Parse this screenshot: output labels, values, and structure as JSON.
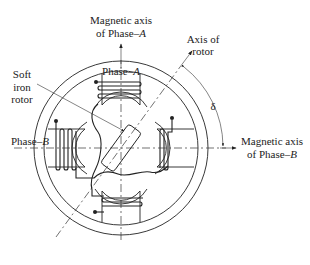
{
  "figure": {
    "type": "diagram",
    "colors": {
      "line": "#222222",
      "background": "#ffffff"
    }
  },
  "labels": {
    "axis_a_line1": "Magnetic axis",
    "axis_a_line2": "of Phase–",
    "axis_a_phase": "A",
    "rotor_axis_line1": "Axis of",
    "rotor_axis_line2": "rotor",
    "soft_line1": "Soft",
    "soft_line2": "iron",
    "soft_line3": "rotor",
    "phase_a": "Phase–",
    "phase_a_letter": "A",
    "phase_b": "Phase–",
    "phase_b_letter": "B",
    "axis_b_line1": "Magnetic axis",
    "axis_b_line2": "of Phase–",
    "axis_b_phase": "B",
    "delta": "δ"
  }
}
